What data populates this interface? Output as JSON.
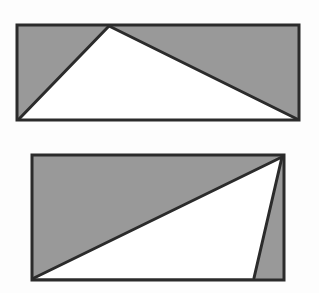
{
  "figure": {
    "title": "Two shaded rectangles with inscribed white triangles",
    "background_color": "#fdfdfd",
    "shaded_fill": "#999999",
    "unshaded_fill": "#ffffff",
    "stroke_color": "#2b2b2b",
    "stroke_width": 3,
    "shape_count": 2
  },
  "shapes": [
    {
      "id": "upper",
      "name": "upper-rectangle",
      "label": "Upper rectangle with inscribed white triangle",
      "rect": {
        "x": 17,
        "y": 25,
        "width": 282,
        "height": 95
      },
      "rect_points": "17,25 299,25 299,120 17,120",
      "white_region_points": "19,119 109,26 297,119",
      "white_region_description": "triangle with apex on the top edge and base on the bottom edge",
      "apex": {
        "x": 109,
        "y": 26
      },
      "base_left": {
        "x": 19,
        "y": 119
      },
      "base_right": {
        "x": 297,
        "y": 119
      },
      "shaded_parts": 2,
      "shaded_part_labels": [
        "left shaded triangle",
        "right shaded triangle"
      ]
    },
    {
      "id": "lower",
      "name": "lower-rectangle",
      "label": "Lower rectangle with inscribed white triangle",
      "rect": {
        "x": 32,
        "y": 155,
        "width": 252,
        "height": 125
      },
      "rect_points": "32,155 284,155 284,280 32,280",
      "white_region_points": "34,278 282,157 254,278",
      "white_region_description": "triangle with apex at the top right corner and base along the bottom edge",
      "apex": {
        "x": 282,
        "y": 157
      },
      "base_left": {
        "x": 34,
        "y": 278
      },
      "base_right": {
        "x": 254,
        "y": 278
      },
      "shaded_parts": 2,
      "shaded_part_labels": [
        "upper-left shaded triangle",
        "right shaded sliver"
      ]
    }
  ]
}
